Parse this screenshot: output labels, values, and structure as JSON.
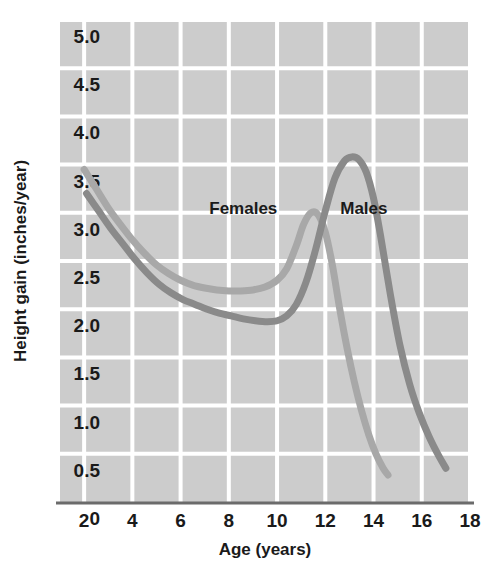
{
  "chart_data": {
    "type": "line",
    "title": "",
    "xlabel": "Age (years)",
    "ylabel": "Height gain (inches/year)",
    "xlim": [
      1,
      18
    ],
    "ylim": [
      0,
      5.0
    ],
    "grid": true,
    "legend_position": "inline-annotations",
    "xticks": [
      "2",
      "4",
      "6",
      "8",
      "10",
      "12",
      "14",
      "16",
      "18"
    ],
    "xtick_values": [
      2,
      4,
      6,
      8,
      10,
      12,
      14,
      16,
      18
    ],
    "yticks": [
      "5.0",
      "4.5",
      "4.0",
      "3.5",
      "3.0",
      "2.5",
      "2.0",
      "1.5",
      "1.0",
      "0.5",
      "0"
    ],
    "ytick_values": [
      5.0,
      4.5,
      4.0,
      3.5,
      3.0,
      2.5,
      2.0,
      1.5,
      1.0,
      0.5,
      0
    ],
    "plot_background_color": "#cccccc",
    "gridline_color": "#ffffff",
    "axis_line_color": "#6b6b6b",
    "series": [
      {
        "name": "Females",
        "color": "#a8a8a8",
        "label_x": 8.6,
        "label_y": 3.05,
        "x": [
          2.0,
          2.5,
          3.0,
          3.5,
          4.0,
          4.5,
          5.0,
          5.5,
          6.0,
          6.5,
          7.0,
          7.5,
          8.0,
          8.5,
          9.0,
          9.5,
          10.0,
          10.4,
          10.8,
          11.1,
          11.4,
          11.7,
          12.0,
          12.3,
          12.6,
          12.9,
          13.2,
          13.5,
          13.8,
          14.1,
          14.4,
          14.6
        ],
        "y": [
          3.45,
          3.25,
          3.05,
          2.88,
          2.72,
          2.58,
          2.46,
          2.37,
          2.3,
          2.25,
          2.22,
          2.2,
          2.19,
          2.19,
          2.2,
          2.23,
          2.3,
          2.42,
          2.66,
          2.88,
          3.0,
          2.98,
          2.8,
          2.45,
          2.0,
          1.6,
          1.25,
          0.95,
          0.7,
          0.5,
          0.35,
          0.28
        ]
      },
      {
        "name": "Males",
        "color": "#8a8a8a",
        "label_x": 13.6,
        "label_y": 3.05,
        "x": [
          2.1,
          2.6,
          3.1,
          3.6,
          4.1,
          4.6,
          5.1,
          5.6,
          6.1,
          6.6,
          7.1,
          7.6,
          8.1,
          8.6,
          9.1,
          9.6,
          10.0,
          10.4,
          10.8,
          11.2,
          11.6,
          12.0,
          12.4,
          12.8,
          13.1,
          13.4,
          13.7,
          14.0,
          14.3,
          14.7,
          15.1,
          15.5,
          15.9,
          16.3,
          16.7,
          17.0
        ],
        "y": [
          3.2,
          3.02,
          2.84,
          2.68,
          2.52,
          2.38,
          2.26,
          2.17,
          2.1,
          2.05,
          2.0,
          1.96,
          1.93,
          1.9,
          1.88,
          1.87,
          1.88,
          1.93,
          2.05,
          2.28,
          2.62,
          3.02,
          3.36,
          3.54,
          3.58,
          3.55,
          3.42,
          3.15,
          2.75,
          2.15,
          1.62,
          1.22,
          0.92,
          0.68,
          0.48,
          0.35
        ]
      }
    ],
    "annotations": [
      {
        "text": "Females",
        "x": 8.6,
        "y": 3.05
      },
      {
        "text": "Males",
        "x": 13.6,
        "y": 3.05
      }
    ]
  }
}
